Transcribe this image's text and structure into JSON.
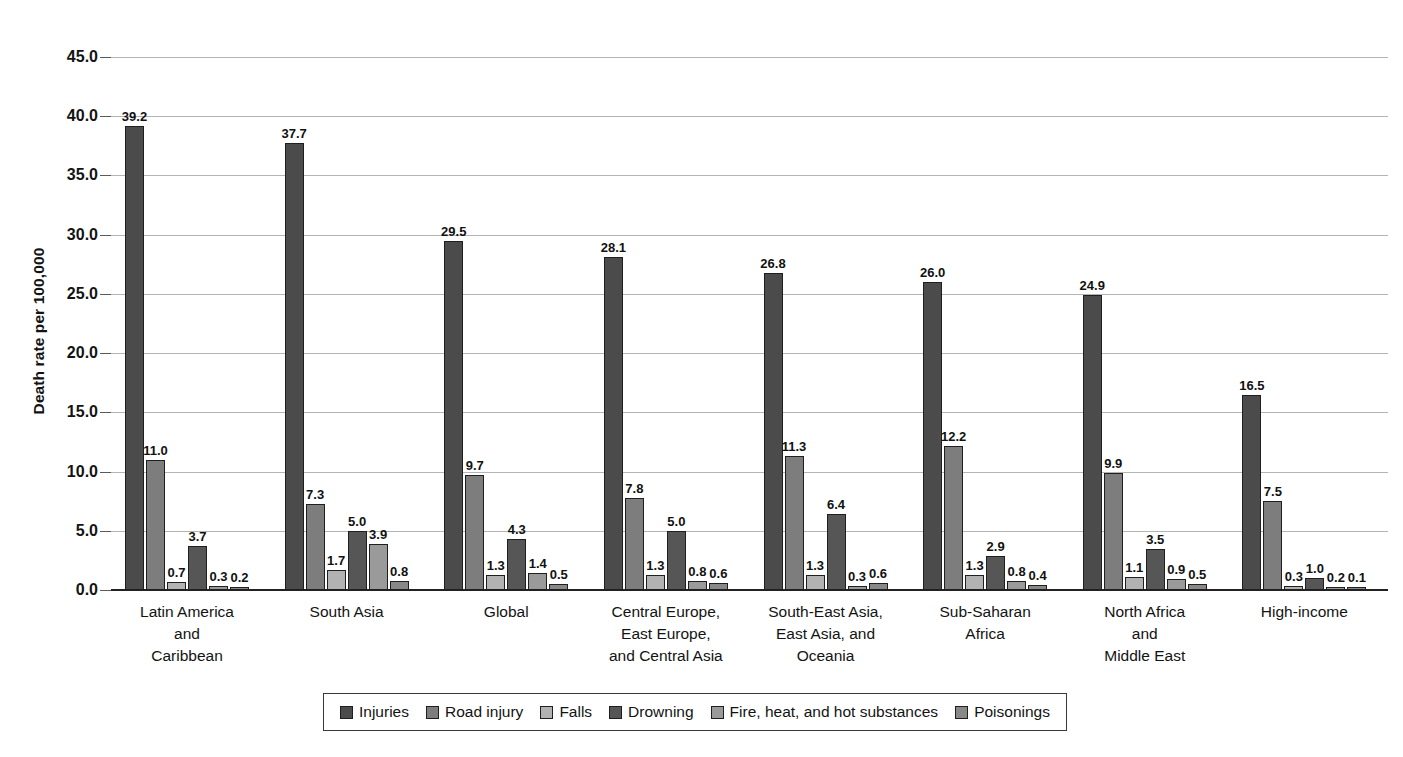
{
  "chart_data": {
    "type": "bar",
    "title": "",
    "xlabel": "",
    "ylabel": "Death rate per 100,000",
    "ylim": [
      0,
      45
    ],
    "ytick_step": 5,
    "grid": true,
    "legend_position": "bottom",
    "yticks": [
      "0.0",
      "5.0",
      "10.0",
      "15.0",
      "20.0",
      "25.0",
      "30.0",
      "35.0",
      "40.0",
      "45.0"
    ],
    "categories": [
      "Latin America\nand\nCaribbean",
      "South Asia",
      "Global",
      "Central Europe,\nEast Europe,\nand Central Asia",
      "South-East Asia,\nEast Asia, and\nOceania",
      "Sub-Saharan\nAfrica",
      "North Africa\nand\nMiddle East",
      "High-income"
    ],
    "series": [
      {
        "name": "Injuries",
        "color": "#4b4b4b",
        "values": [
          39.2,
          37.7,
          29.5,
          28.1,
          26.8,
          26.0,
          24.9,
          16.5
        ],
        "labels": [
          "39.2",
          "37.7",
          "29.5",
          "28.1",
          "26.8",
          "26.0",
          "24.9",
          "16.5"
        ]
      },
      {
        "name": "Road injury",
        "color": "#7d7d7d",
        "values": [
          11.0,
          7.3,
          9.7,
          7.8,
          11.3,
          12.2,
          9.9,
          7.5
        ],
        "labels": [
          "11.0",
          "7.3",
          "9.7",
          "7.8",
          "11.3",
          "12.2",
          "9.9",
          "7.5"
        ]
      },
      {
        "name": "Falls",
        "color": "#b2b2b2",
        "values": [
          0.7,
          1.7,
          1.3,
          1.3,
          1.3,
          1.3,
          1.1,
          0.3
        ],
        "labels": [
          "0.7",
          "1.7",
          "1.3",
          "1.3",
          "1.3",
          "1.3",
          "1.1",
          "0.3"
        ]
      },
      {
        "name": "Drowning",
        "color": "#565656",
        "values": [
          3.7,
          5.0,
          4.3,
          5.0,
          6.4,
          2.9,
          3.5,
          1.0
        ],
        "labels": [
          "3.7",
          "5.0",
          "4.3",
          "5.0",
          "6.4",
          "2.9",
          "3.5",
          "1.0"
        ]
      },
      {
        "name": "Fire, heat, and hot substances",
        "color": "#9a9a9a",
        "values": [
          0.3,
          3.9,
          1.4,
          0.8,
          0.3,
          0.8,
          0.9,
          0.2
        ],
        "labels": [
          "0.3",
          "3.9",
          "1.4",
          "0.8",
          "0.3",
          "0.8",
          "0.9",
          "0.2"
        ]
      },
      {
        "name": "Poisonings",
        "color": "#888888",
        "values": [
          0.2,
          0.8,
          0.5,
          0.6,
          0.6,
          0.4,
          0.5,
          0.1
        ],
        "labels": [
          "0.2",
          "0.8",
          "0.5",
          "0.6",
          "0.6",
          "0.4",
          "0.5",
          "0.1"
        ]
      }
    ]
  },
  "legend": {
    "items": [
      {
        "label": "Injuries",
        "color": "#4b4b4b"
      },
      {
        "label": "Road injury",
        "color": "#7d7d7d"
      },
      {
        "label": "Falls",
        "color": "#b2b2b2"
      },
      {
        "label": "Drowning",
        "color": "#565656"
      },
      {
        "label": "Fire, heat, and hot substances",
        "color": "#9a9a9a"
      },
      {
        "label": "Poisonings",
        "color": "#888888"
      }
    ]
  }
}
